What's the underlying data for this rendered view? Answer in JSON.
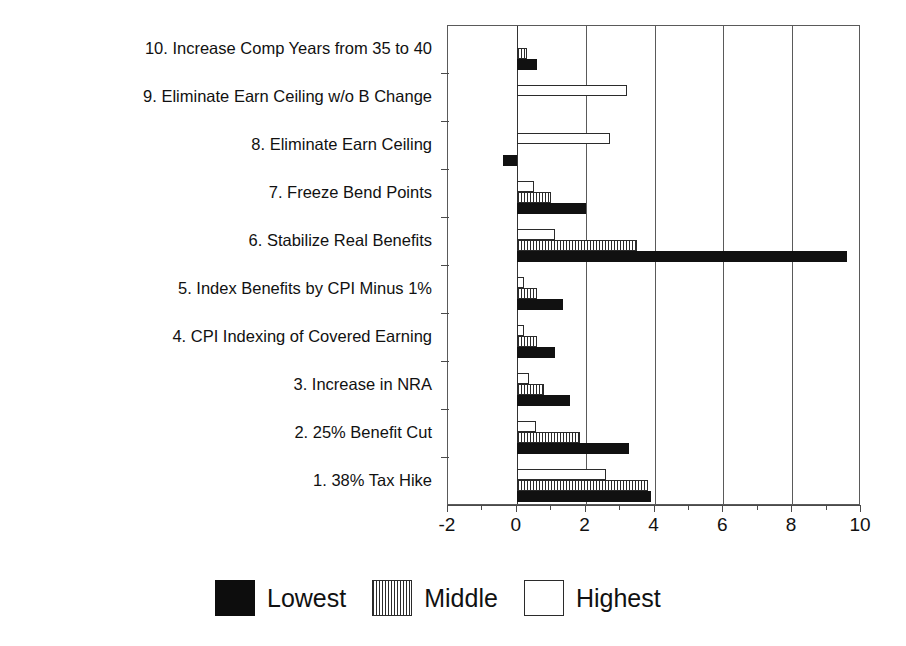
{
  "chart_data": {
    "type": "bar",
    "orientation": "horizontal",
    "title": "",
    "xlabel": "",
    "ylabel": "",
    "xlim": [
      -2,
      10
    ],
    "xticks": [
      -2,
      0,
      2,
      4,
      6,
      8,
      10
    ],
    "xtick_labels": [
      "-2",
      "0",
      "2",
      "4",
      "6",
      "8",
      "10"
    ],
    "minor_xticks": [
      -1,
      1,
      3,
      5,
      7,
      9
    ],
    "grid": "vertical-major",
    "legend_position": "bottom-center",
    "categories": [
      "1. 38% Tax Hike",
      "2. 25% Benefit Cut",
      "3. Increase in NRA",
      "4. CPI Indexing of Covered Earning",
      "5. Index Benefits by CPI Minus 1%",
      "6. Stabilize Real Benefits",
      "7. Freeze Bend Points",
      "8. Eliminate Earn Ceiling",
      "9. Eliminate Earn Ceiling w/o B Change",
      "10. Increase Comp Years from 35 to 40"
    ],
    "series": [
      {
        "name": "Lowest",
        "color": "#111111",
        "pattern": "solid",
        "values": [
          3.9,
          3.25,
          1.55,
          1.1,
          1.35,
          9.6,
          2.0,
          -0.4,
          0.0,
          0.6
        ]
      },
      {
        "name": "Middle",
        "color": "#2b2b2b",
        "pattern": "vertical-stripes",
        "values": [
          3.8,
          1.85,
          0.8,
          0.6,
          0.6,
          3.5,
          1.0,
          0.0,
          0.0,
          0.3
        ]
      },
      {
        "name": "Highest",
        "color": "#ffffff",
        "pattern": "empty",
        "values": [
          2.6,
          0.55,
          0.35,
          0.2,
          0.2,
          1.1,
          0.5,
          2.7,
          3.2,
          0.0
        ]
      }
    ]
  },
  "legend": {
    "items": [
      {
        "label": "Lowest",
        "swatch": "solid-black-swatch"
      },
      {
        "label": "Middle",
        "swatch": "striped-swatch"
      },
      {
        "label": "Highest",
        "swatch": "empty-swatch"
      }
    ]
  }
}
